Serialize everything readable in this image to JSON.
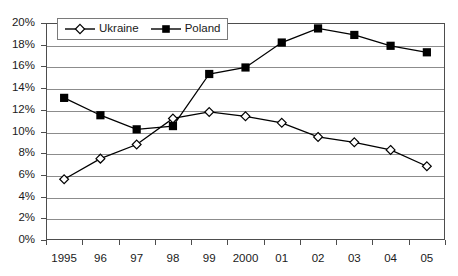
{
  "chart_data": {
    "type": "line",
    "title": "",
    "subtitle": "",
    "xlabel": "",
    "ylabel": "",
    "categories": [
      "1995",
      "96",
      "97",
      "98",
      "99",
      "2000",
      "01",
      "02",
      "03",
      "04",
      "05"
    ],
    "series": [
      {
        "name": "Ukraine",
        "marker": "open-diamond",
        "color": "#000000",
        "values": [
          5.6,
          7.5,
          8.8,
          11.2,
          11.8,
          11.4,
          10.8,
          9.5,
          9.0,
          8.3,
          6.8
        ]
      },
      {
        "name": "Poland",
        "marker": "filled-square",
        "color": "#000000",
        "values": [
          13.1,
          11.5,
          10.2,
          10.5,
          15.3,
          15.9,
          18.2,
          19.5,
          18.9,
          17.9,
          17.3
        ]
      }
    ],
    "ylim": [
      0,
      20
    ],
    "ytick_step": 2,
    "ytick_labels": [
      "0%",
      "2%",
      "4%",
      "6%",
      "8%",
      "10%",
      "12%",
      "14%",
      "16%",
      "18%",
      "20%"
    ],
    "grid": true,
    "grid_axis": "y",
    "legend_position": "top-left-inside",
    "value_suffix": "%"
  },
  "legend": {
    "entries": [
      {
        "label": "Ukraine"
      },
      {
        "label": "Poland"
      }
    ]
  }
}
